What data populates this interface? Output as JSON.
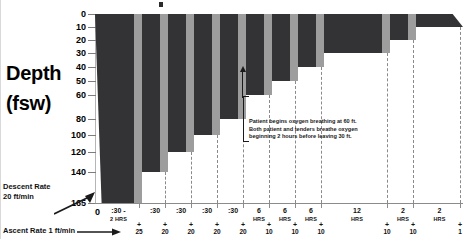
{
  "axis_titles": {
    "depth": "Depth",
    "unit": "(fsw)"
  },
  "annotations": {
    "descent_rate": "Descent Rate",
    "descent_rate_value": "20 ft/min",
    "ascent_rate": "Ascent Rate 1 ft/min",
    "oxygen_note": "Patient begins oxygen breathing at 60 ft.  Both patient and tenders breathe oxygen beginning 2 hours before leaving 30 ft."
  },
  "colors": {
    "bar": "#333335",
    "bar_shade": "#9d9d9d",
    "axis": "#8c8c8c",
    "dashed": "#8a8a8a",
    "text": "#111111",
    "background": "#ffffff"
  },
  "chart_data": {
    "type": "bar",
    "title": "",
    "xlabel": "",
    "ylabel": "Depth (fsw)",
    "ylim": [
      0,
      165
    ],
    "y_inverted": true,
    "grid": false,
    "y_ticks": [
      0,
      10,
      20,
      30,
      40,
      50,
      60,
      80,
      100,
      120,
      140,
      165
    ],
    "y_tick_labels": [
      "0",
      "10",
      "20",
      "30",
      "40",
      "50",
      "60",
      "80",
      "100",
      "120",
      "140",
      "165"
    ],
    "x_origin_label": "0",
    "categories": [
      ":30 - 2 HRS",
      ":30",
      ":30",
      ":30",
      ":30",
      "6 HRS",
      "6 HRS",
      "6 HRS",
      "12 HRS",
      "2 HRS",
      "2 HRS"
    ],
    "stop_depths": [
      165,
      140,
      120,
      100,
      80,
      60,
      50,
      40,
      30,
      20,
      10
    ],
    "ascent_labels": [
      "+ 25",
      "+ 20",
      "+ 20",
      "+ 20",
      "+ 20",
      "+ 10",
      "+ 10",
      "+ 10",
      "+ 10",
      "+ 10",
      "+ 1"
    ],
    "values": [
      165,
      140,
      120,
      100,
      80,
      60,
      50,
      40,
      30,
      20,
      10
    ],
    "series": [
      {
        "name": "Treatment depth profile (fsw)",
        "values": [
          165,
          140,
          120,
          100,
          80,
          60,
          50,
          40,
          30,
          20,
          10
        ]
      }
    ],
    "segments": [
      {
        "label": ":30 - 2 HRS",
        "label_top": ":30 -",
        "label_bottom": "2 HRS",
        "depth": 165,
        "ascent": "25",
        "duration_hint": "0:30 to 2 hours"
      },
      {
        "label": ":30",
        "label_top": ":30",
        "label_bottom": "",
        "depth": 140,
        "ascent": "20",
        "duration_hint": "30 min"
      },
      {
        "label": ":30",
        "label_top": ":30",
        "label_bottom": "",
        "depth": 120,
        "ascent": "20",
        "duration_hint": "30 min"
      },
      {
        "label": ":30",
        "label_top": ":30",
        "label_bottom": "",
        "depth": 100,
        "ascent": "20",
        "duration_hint": "30 min"
      },
      {
        "label": ":30",
        "label_top": ":30",
        "label_bottom": "",
        "depth": 80,
        "ascent": "20",
        "duration_hint": "30 min"
      },
      {
        "label": "6 HRS",
        "label_top": "6",
        "label_bottom": "HRS",
        "depth": 60,
        "ascent": "10",
        "duration_hint": "6 hours"
      },
      {
        "label": "6 HRS",
        "label_top": "6",
        "label_bottom": "HRS",
        "depth": 50,
        "ascent": "10",
        "duration_hint": "6 hours"
      },
      {
        "label": "6 HRS",
        "label_top": "6",
        "label_bottom": "HRS",
        "depth": 40,
        "ascent": "10",
        "duration_hint": "6 hours"
      },
      {
        "label": "12 HRS",
        "label_top": "12",
        "label_bottom": "HRS",
        "depth": 30,
        "ascent": "10",
        "duration_hint": "12 hours"
      },
      {
        "label": "2 HRS",
        "label_top": "2",
        "label_bottom": "HRS",
        "depth": 20,
        "ascent": "10",
        "duration_hint": "2 hours"
      },
      {
        "label": "2 HRS",
        "label_top": "2",
        "label_bottom": "HRS",
        "depth": 10,
        "ascent": "1",
        "duration_hint": "2 hours"
      }
    ]
  }
}
